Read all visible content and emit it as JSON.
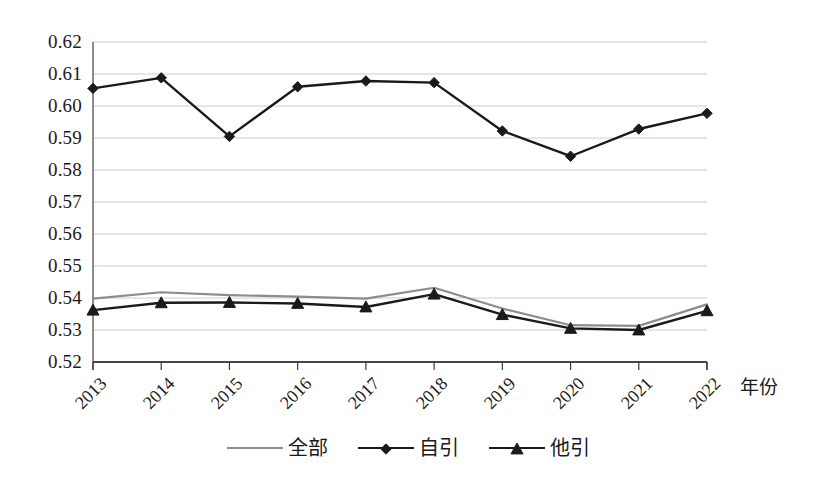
{
  "chart_data": {
    "type": "line",
    "title": "",
    "xlabel": "年份",
    "ylabel": "",
    "categories": [
      "2013",
      "2014",
      "2015",
      "2016",
      "2017",
      "2018",
      "2019",
      "2020",
      "2021",
      "2022"
    ],
    "ylim": [
      0.52,
      0.62
    ],
    "ytick_labels": [
      "0.62",
      "0.61",
      "0.60",
      "0.59",
      "0.58",
      "0.57",
      "0.56",
      "0.55",
      "0.54",
      "0.53",
      "0.52"
    ],
    "ytick_values": [
      0.62,
      0.61,
      0.6,
      0.59,
      0.58,
      0.57,
      0.56,
      0.55,
      0.54,
      0.53,
      0.52
    ],
    "grid": true,
    "grid_axis": "y",
    "legend_position": "bottom",
    "series": [
      {
        "name": "全部",
        "marker": "none",
        "color": "#8c8c8c",
        "values": [
          0.5398,
          0.5418,
          0.5409,
          0.5404,
          0.5398,
          0.5432,
          0.5367,
          0.5315,
          0.5313,
          0.538
        ]
      },
      {
        "name": "自引",
        "marker": "diamond",
        "color": "#1a1a1a",
        "values": [
          0.6055,
          0.6088,
          0.5905,
          0.606,
          0.6078,
          0.6073,
          0.5922,
          0.5843,
          0.5928,
          0.5977
        ]
      },
      {
        "name": "他引",
        "marker": "triangle",
        "color": "#1a1a1a",
        "values": [
          0.5362,
          0.5385,
          0.5386,
          0.5383,
          0.5372,
          0.5412,
          0.5348,
          0.5305,
          0.53,
          0.536
        ]
      }
    ]
  },
  "legend": {
    "items": [
      {
        "label": "全部",
        "marker": "none"
      },
      {
        "label": "自引",
        "marker": "diamond"
      },
      {
        "label": "他引",
        "marker": "triangle"
      }
    ]
  },
  "axes": {
    "x_title": "年份"
  }
}
